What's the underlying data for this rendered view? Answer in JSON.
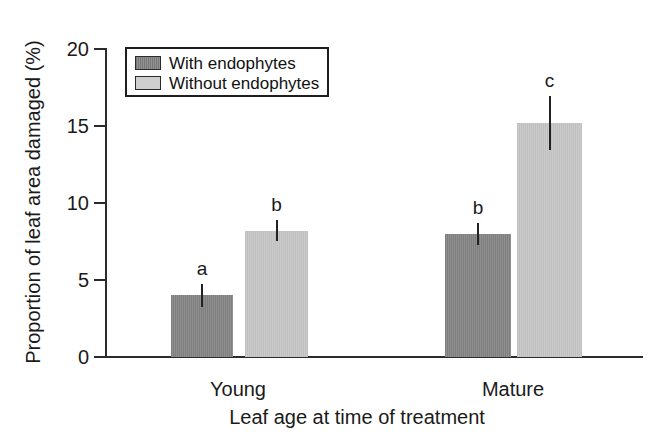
{
  "chart_data": {
    "type": "bar",
    "title": "",
    "xlabel": "Leaf age at time of treatment",
    "ylabel": "Proportion of leaf area damaged (%)",
    "categories": [
      "Young",
      "Mature"
    ],
    "ylim": [
      0,
      20
    ],
    "yticks": [
      0,
      5,
      10,
      15,
      20
    ],
    "ytick_labels": [
      "0",
      "5",
      "10",
      "15",
      "20"
    ],
    "grid": false,
    "legend_position": "upper-left-inside",
    "series": [
      {
        "name": "With endophytes",
        "color": "#8a8a8a",
        "values": [
          4.0,
          8.0
        ],
        "errors": [
          0.75,
          0.7
        ],
        "annotations": [
          "a",
          "b"
        ]
      },
      {
        "name": "Without endophytes",
        "color": "#c9c9c9",
        "values": [
          8.2,
          15.2
        ],
        "errors": [
          0.7,
          1.75
        ],
        "annotations": [
          "b",
          "c"
        ]
      }
    ],
    "bars": [
      {
        "id": "young-with",
        "group": "Young",
        "series": "With endophytes",
        "value": 4.0,
        "error": 0.75,
        "annotation": "a",
        "fill": "dark"
      },
      {
        "id": "young-without",
        "group": "Young",
        "series": "Without endophytes",
        "value": 8.2,
        "error": 0.7,
        "annotation": "b",
        "fill": "light"
      },
      {
        "id": "mature-with",
        "group": "Mature",
        "series": "With endophytes",
        "value": 8.0,
        "error": 0.7,
        "annotation": "b",
        "fill": "dark"
      },
      {
        "id": "mature-without",
        "group": "Mature",
        "series": "Without endophytes",
        "value": 15.2,
        "error": 1.75,
        "annotation": "c",
        "fill": "light"
      }
    ]
  },
  "legend": {
    "items": [
      {
        "label": "With endophytes",
        "swatch": "dark"
      },
      {
        "label": "Without endophytes",
        "swatch": "light"
      }
    ]
  }
}
